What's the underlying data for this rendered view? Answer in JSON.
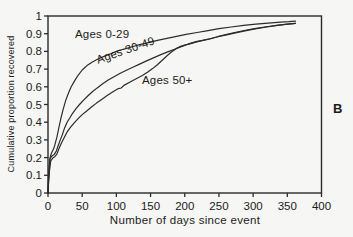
{
  "panel_label": "B",
  "colors": {
    "background": "#f6f6f4",
    "line": "#2b2b2b",
    "text": "#1b1b1b"
  },
  "chart_data": {
    "type": "line",
    "title": "",
    "xlabel": "Number of days since event",
    "ylabel": "Cumulative proportion recovered",
    "xlim": [
      0,
      400
    ],
    "ylim": [
      0,
      1
    ],
    "grid": false,
    "legend_position": "inline-curve-labels",
    "frame": "full-box",
    "x_ticks": [
      0,
      50,
      100,
      150,
      200,
      250,
      300,
      350,
      400
    ],
    "x_tick_labels": [
      "0",
      "50",
      "100",
      "150",
      "200",
      "250",
      "300",
      "350",
      "400"
    ],
    "y_ticks": [
      0,
      0.1,
      0.2,
      0.3,
      0.4,
      0.5,
      0.6,
      0.7,
      0.8,
      0.9,
      1
    ],
    "y_tick_labels": [
      "0",
      "0.1",
      "0.2",
      "0.3",
      "0.4",
      "0.5",
      "0.6",
      "0.7",
      "0.8",
      "0.9",
      "1"
    ],
    "series": [
      {
        "name": "Ages 0-29",
        "points": [
          [
            0,
            0
          ],
          [
            1,
            0.11
          ],
          [
            2,
            0.16
          ],
          [
            3,
            0.2
          ],
          [
            5,
            0.225
          ],
          [
            8,
            0.248
          ],
          [
            10,
            0.27
          ],
          [
            13,
            0.315
          ],
          [
            16,
            0.37
          ],
          [
            19,
            0.425
          ],
          [
            22,
            0.47
          ],
          [
            26,
            0.525
          ],
          [
            30,
            0.565
          ],
          [
            34,
            0.6
          ],
          [
            39,
            0.635
          ],
          [
            44,
            0.665
          ],
          [
            50,
            0.695
          ],
          [
            57,
            0.72
          ],
          [
            65,
            0.74
          ],
          [
            73,
            0.757
          ],
          [
            82,
            0.772
          ],
          [
            92,
            0.787
          ],
          [
            100,
            0.8
          ],
          [
            110,
            0.812
          ],
          [
            122,
            0.825
          ],
          [
            134,
            0.838
          ],
          [
            147,
            0.85
          ],
          [
            160,
            0.862
          ],
          [
            174,
            0.874
          ],
          [
            188,
            0.885
          ],
          [
            202,
            0.896
          ],
          [
            218,
            0.907
          ],
          [
            234,
            0.917
          ],
          [
            250,
            0.928
          ],
          [
            268,
            0.938
          ],
          [
            286,
            0.947
          ],
          [
            304,
            0.954
          ],
          [
            322,
            0.96
          ],
          [
            340,
            0.965
          ],
          [
            352,
            0.968
          ],
          [
            362,
            0.971
          ]
        ]
      },
      {
        "name": "Ages 30-49",
        "points": [
          [
            0,
            0
          ],
          [
            1,
            0.09
          ],
          [
            2,
            0.15
          ],
          [
            3,
            0.195
          ],
          [
            6,
            0.21
          ],
          [
            9,
            0.218
          ],
          [
            12,
            0.235
          ],
          [
            15,
            0.27
          ],
          [
            18,
            0.3
          ],
          [
            21,
            0.33
          ],
          [
            24,
            0.365
          ],
          [
            28,
            0.4
          ],
          [
            32,
            0.425
          ],
          [
            36,
            0.45
          ],
          [
            41,
            0.477
          ],
          [
            46,
            0.5
          ],
          [
            52,
            0.525
          ],
          [
            58,
            0.548
          ],
          [
            65,
            0.572
          ],
          [
            72,
            0.594
          ],
          [
            80,
            0.617
          ],
          [
            88,
            0.638
          ],
          [
            96,
            0.655
          ],
          [
            105,
            0.675
          ],
          [
            114,
            0.692
          ],
          [
            124,
            0.71
          ],
          [
            134,
            0.728
          ],
          [
            145,
            0.748
          ],
          [
            155,
            0.765
          ],
          [
            165,
            0.782
          ],
          [
            175,
            0.797
          ],
          [
            185,
            0.812
          ],
          [
            195,
            0.827
          ],
          [
            205,
            0.84
          ],
          [
            215,
            0.851
          ],
          [
            226,
            0.862
          ],
          [
            238,
            0.873
          ],
          [
            250,
            0.884
          ],
          [
            263,
            0.895
          ],
          [
            276,
            0.906
          ],
          [
            290,
            0.917
          ],
          [
            305,
            0.928
          ],
          [
            320,
            0.938
          ],
          [
            335,
            0.947
          ],
          [
            350,
            0.954
          ],
          [
            362,
            0.959
          ]
        ]
      },
      {
        "name": "Ages 50+",
        "points": [
          [
            0,
            0
          ],
          [
            1,
            0.07
          ],
          [
            2,
            0.12
          ],
          [
            4,
            0.18
          ],
          [
            7,
            0.198
          ],
          [
            10,
            0.205
          ],
          [
            13,
            0.22
          ],
          [
            16,
            0.25
          ],
          [
            20,
            0.285
          ],
          [
            24,
            0.315
          ],
          [
            28,
            0.345
          ],
          [
            33,
            0.372
          ],
          [
            38,
            0.395
          ],
          [
            44,
            0.42
          ],
          [
            50,
            0.443
          ],
          [
            57,
            0.465
          ],
          [
            64,
            0.487
          ],
          [
            71,
            0.508
          ],
          [
            79,
            0.53
          ],
          [
            87,
            0.552
          ],
          [
            95,
            0.572
          ],
          [
            103,
            0.59
          ],
          [
            107,
            0.593
          ],
          [
            111,
            0.608
          ],
          [
            120,
            0.627
          ],
          [
            129,
            0.645
          ],
          [
            138,
            0.664
          ],
          [
            146,
            0.683
          ],
          [
            153,
            0.703
          ],
          [
            160,
            0.725
          ],
          [
            167,
            0.75
          ],
          [
            174,
            0.775
          ],
          [
            181,
            0.798
          ],
          [
            188,
            0.817
          ],
          [
            195,
            0.83
          ],
          [
            202,
            0.838
          ],
          [
            210,
            0.848
          ],
          [
            218,
            0.857
          ],
          [
            227,
            0.862
          ],
          [
            237,
            0.87
          ],
          [
            248,
            0.883
          ],
          [
            260,
            0.895
          ],
          [
            273,
            0.907
          ],
          [
            287,
            0.918
          ],
          [
            302,
            0.929
          ],
          [
            317,
            0.938
          ],
          [
            332,
            0.946
          ],
          [
            347,
            0.953
          ],
          [
            362,
            0.958
          ]
        ]
      }
    ]
  }
}
